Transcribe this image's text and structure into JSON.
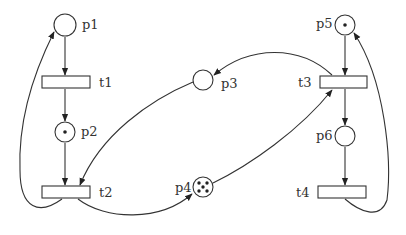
{
  "diagram": {
    "type": "petri-net",
    "colors": {
      "stroke": "#333333",
      "token": "#222222",
      "background": "#ffffff"
    },
    "places": [
      {
        "id": "p1",
        "label": "p1",
        "tokens": 0
      },
      {
        "id": "p2",
        "label": "p2",
        "tokens": 1
      },
      {
        "id": "p3",
        "label": "p3",
        "tokens": 0
      },
      {
        "id": "p4",
        "label": "p4",
        "tokens": 5
      },
      {
        "id": "p5",
        "label": "p5",
        "tokens": 1
      },
      {
        "id": "p6",
        "label": "p6",
        "tokens": 0
      }
    ],
    "transitions": [
      {
        "id": "t1",
        "label": "t1"
      },
      {
        "id": "t2",
        "label": "t2"
      },
      {
        "id": "t3",
        "label": "t3"
      },
      {
        "id": "t4",
        "label": "t4"
      }
    ],
    "arcs": [
      {
        "from": "p1",
        "to": "t1"
      },
      {
        "from": "t1",
        "to": "p2"
      },
      {
        "from": "p2",
        "to": "t2"
      },
      {
        "from": "p3",
        "to": "t2"
      },
      {
        "from": "t2",
        "to": "p1"
      },
      {
        "from": "t2",
        "to": "p4"
      },
      {
        "from": "p4",
        "to": "t3"
      },
      {
        "from": "t3",
        "to": "p3"
      },
      {
        "from": "p5",
        "to": "t3"
      },
      {
        "from": "t3",
        "to": "p6"
      },
      {
        "from": "p6",
        "to": "t4"
      },
      {
        "from": "t4",
        "to": "p5"
      }
    ]
  }
}
